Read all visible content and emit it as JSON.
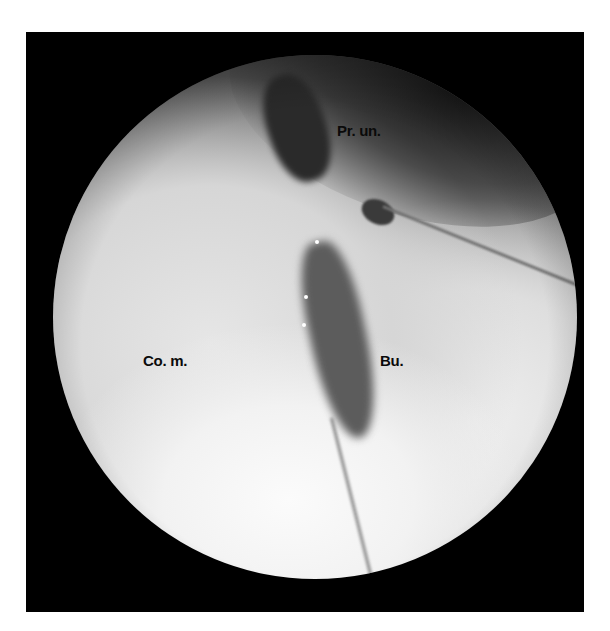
{
  "figure": {
    "type": "endoscopic-view",
    "labels": {
      "processus_uncinatus": "Pr. un.",
      "concha_media": "Co. m.",
      "bulla": "Bu."
    },
    "colors": {
      "frame": "#000000",
      "label_text": "#0a0a0a"
    }
  }
}
